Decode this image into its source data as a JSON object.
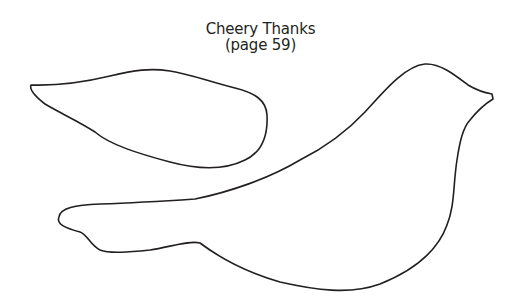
{
  "title": {
    "line1": "Cheery Thanks",
    "line2": "(page 59)"
  },
  "shapes": [
    {
      "name": "wing",
      "type": "outline"
    },
    {
      "name": "bird-body",
      "type": "outline"
    }
  ],
  "colors": {
    "background": "#ffffff",
    "stroke": "#231f20",
    "text": "#231f20"
  }
}
